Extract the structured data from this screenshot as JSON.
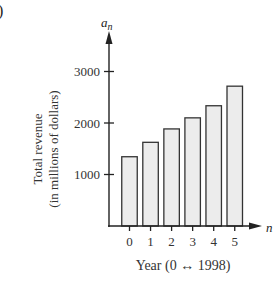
{
  "panel_label": ")",
  "chart_data": {
    "type": "bar",
    "title": "",
    "categories": [
      "0",
      "1",
      "2",
      "3",
      "4",
      "5"
    ],
    "values": [
      1345,
      1625,
      1885,
      2100,
      2335,
      2715
    ],
    "xlabel": "Year (0 ↔ 1998)",
    "ylabel": "Total revenue",
    "ylabel_line2": "(in millions of dollars)",
    "x_axis_symbol": "n",
    "y_axis_symbol": "a",
    "y_axis_symbol_subscript": "n",
    "yticks": [
      1000,
      2000,
      3000
    ],
    "ytick_labels": [
      "1000",
      "2000",
      "3000"
    ],
    "ylim": [
      0,
      3500
    ],
    "grid": false,
    "legend": null,
    "bar_fill": "#ececec",
    "bar_stroke": "#333333",
    "axis_color": "#222222"
  }
}
